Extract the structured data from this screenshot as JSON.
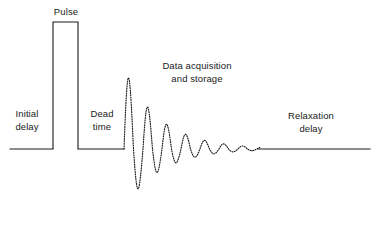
{
  "figure": {
    "kind": "nmr-pulse-sequence-timing-diagram",
    "background_color": "#ffffff",
    "line_color": "#1a1a1a",
    "width": 384,
    "height": 232
  },
  "labels": {
    "pulse": "Pulse",
    "initial_delay": "Initial\ndelay",
    "dead_time": "Dead\ntime",
    "data_acquisition": "Data acquisition\nand storage",
    "relaxation_delay": "Relaxation\ndelay"
  },
  "chart_data": {
    "type": "line",
    "title": "",
    "xlabel": "",
    "ylabel": "",
    "grid": false,
    "legend": "none",
    "axis_visible": false,
    "baseline_y": 149,
    "x_start": 10,
    "x_end": 370,
    "segments": [
      {
        "name": "initial-delay-baseline",
        "style": "solid",
        "x_from": 10,
        "x_to": 53,
        "y": 149,
        "label": "Initial delay"
      },
      {
        "name": "pulse-rectangle",
        "style": "solid",
        "x_from": 53,
        "x_to": 78,
        "y_top": 22,
        "y_bottom": 149,
        "label": "Pulse",
        "amplitude": 127
      },
      {
        "name": "dead-time-baseline",
        "style": "solid",
        "x_from": 78,
        "x_to": 124,
        "y": 149,
        "label": "Dead time"
      },
      {
        "name": "fid-signal",
        "style": "dotted",
        "x_from": 124,
        "x_to": 260,
        "label": "Data acquisition and storage",
        "waveform": "damped-sinusoid",
        "peak_y": 68,
        "trough_y": 208,
        "initial_amplitude_up": 81,
        "initial_amplitude_down": 59,
        "decay_constant": 36,
        "period": 19,
        "phase_deg": 0
      },
      {
        "name": "relaxation-delay-baseline",
        "style": "solid",
        "x_from": 258,
        "x_to": 370,
        "y": 149,
        "label": "Relaxation delay"
      }
    ]
  }
}
